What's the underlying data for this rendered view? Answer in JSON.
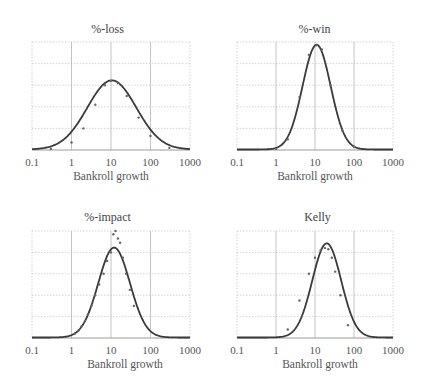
{
  "figure": {
    "panels": [
      {
        "title": "%-loss",
        "xlabel": "Bankroll growth",
        "ticks": [
          "0.1",
          "1",
          "10",
          "100",
          "1000"
        ]
      },
      {
        "title": "%-win",
        "xlabel": "Bankroll growth",
        "ticks": [
          "0.1",
          "1",
          "10",
          "100",
          "1000"
        ]
      },
      {
        "title": "%-impact",
        "xlabel": "Bankroll growth",
        "ticks": [
          "0.1",
          "1",
          "10",
          "100",
          "1000"
        ]
      },
      {
        "title": "Kelly",
        "xlabel": "Bankroll growth",
        "ticks": [
          "0.1",
          "1",
          "10",
          "100",
          "1000"
        ]
      }
    ]
  },
  "chart_data": [
    {
      "type": "line",
      "title": "%-loss",
      "xlabel": "Bankroll growth",
      "ylabel": "",
      "xscale": "log",
      "xlim": [
        0.1,
        1000
      ],
      "xticks": [
        0.1,
        1,
        10,
        100,
        1000
      ],
      "ylim": [
        0,
        1
      ],
      "grid": true,
      "series": [
        {
          "name": "fitted curve",
          "style": "line",
          "peak_x": 10.5,
          "peak_y": 0.64,
          "log_sigma": 0.62
        },
        {
          "name": "simulation",
          "style": "scatter",
          "x": [
            0.3,
            1,
            2,
            4,
            7,
            10,
            15,
            25,
            50,
            100,
            300
          ],
          "y": [
            0.01,
            0.07,
            0.2,
            0.42,
            0.6,
            0.64,
            0.62,
            0.5,
            0.3,
            0.13,
            0.02
          ]
        }
      ]
    },
    {
      "type": "line",
      "title": "%-win",
      "xlabel": "Bankroll growth",
      "ylabel": "",
      "xscale": "log",
      "xlim": [
        0.1,
        1000
      ],
      "xticks": [
        0.1,
        1,
        10,
        100,
        1000
      ],
      "ylim": [
        0,
        1
      ],
      "grid": true,
      "series": [
        {
          "name": "fitted curve",
          "style": "line",
          "peak_x": 11,
          "peak_y": 0.97,
          "log_sigma": 0.36
        },
        {
          "name": "simulation",
          "style": "scatter",
          "x": [
            1,
            2,
            4,
            7,
            11,
            15,
            25,
            50,
            100
          ],
          "y": [
            0.01,
            0.1,
            0.49,
            0.88,
            0.97,
            0.93,
            0.6,
            0.18,
            0.03
          ]
        }
      ]
    },
    {
      "type": "line",
      "title": "%-impact",
      "xlabel": "Bankroll growth",
      "ylabel": "",
      "xscale": "log",
      "xlim": [
        0.1,
        1000
      ],
      "xticks": [
        0.1,
        1,
        10,
        100,
        1000
      ],
      "ylim": [
        0,
        1
      ],
      "grid": true,
      "series": [
        {
          "name": "fitted curve",
          "style": "line",
          "peak_x": 12,
          "peak_y": 0.84,
          "log_sigma": 0.4
        },
        {
          "name": "simulation",
          "style": "scatter",
          "x": [
            1.2,
            1.5,
            1.8,
            2.2,
            2.6,
            3.2,
            4,
            5,
            6.5,
            8,
            10,
            11.5,
            13,
            15,
            17,
            20,
            24,
            30,
            38
          ],
          "y": [
            0.04,
            0.07,
            0.11,
            0.16,
            0.22,
            0.3,
            0.4,
            0.5,
            0.6,
            0.72,
            0.8,
            0.97,
            1.0,
            0.93,
            0.89,
            0.75,
            0.6,
            0.45,
            0.3
          ]
        }
      ]
    },
    {
      "type": "line",
      "title": "Kelly",
      "xlabel": "Bankroll growth",
      "ylabel": "",
      "xscale": "log",
      "xlim": [
        0.1,
        1000
      ],
      "xticks": [
        0.1,
        1,
        10,
        100,
        1000
      ],
      "ylim": [
        0,
        1
      ],
      "grid": true,
      "series": [
        {
          "name": "fitted curve",
          "style": "line",
          "peak_x": 20,
          "peak_y": 0.88,
          "log_sigma": 0.37
        },
        {
          "name": "simulation",
          "style": "scatter",
          "x": [
            2,
            4,
            7,
            10,
            14,
            18,
            22,
            27,
            33,
            45,
            70
          ],
          "y": [
            0.08,
            0.35,
            0.6,
            0.75,
            0.82,
            0.84,
            0.83,
            0.75,
            0.62,
            0.4,
            0.12
          ]
        }
      ]
    }
  ]
}
